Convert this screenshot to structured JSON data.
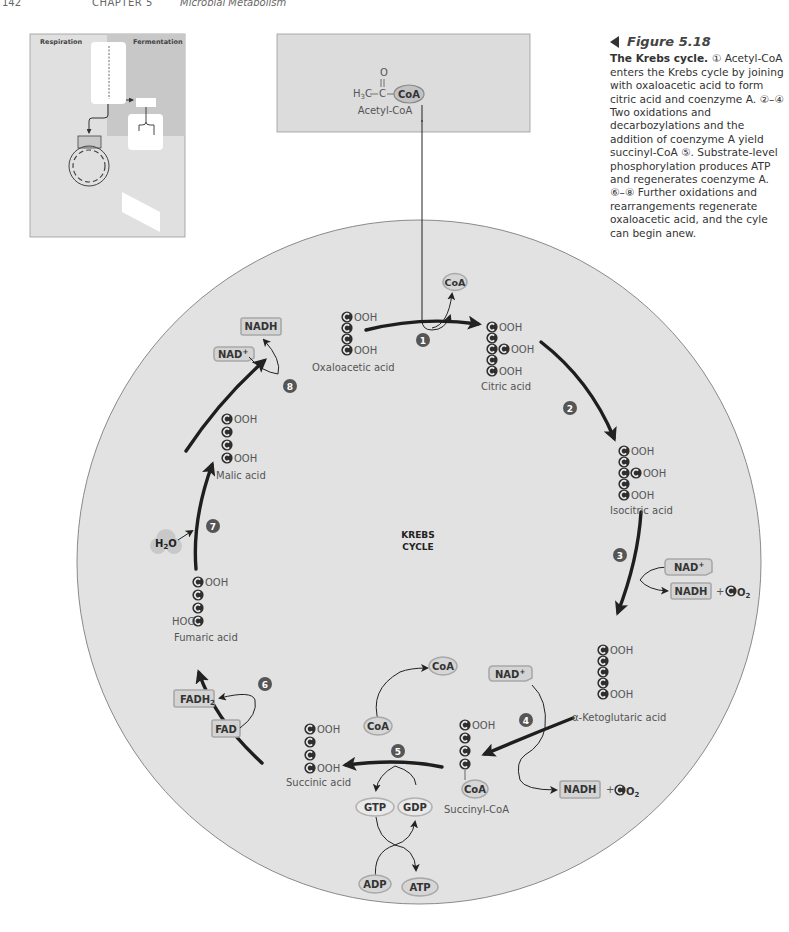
{
  "page_header": {
    "page_number": "142",
    "chapter": "CHAPTER 5",
    "chapter_title": "Microbial Metabolism"
  },
  "caption": {
    "figure_label": "Figure 5.18",
    "lead": "The Krebs cycle.",
    "body": "① Acetyl-CoA enters the Krebs cycle by joining with oxaloacetic acid to form citric acid and coenzyme A. ②–④ Two oxidations and decarbozylations and the addition of coenzyme A yield succinyl-CoA ⑤. Substrate-level phosphorylation produces ATP and regenerates coenzyme A. ⑥–⑧ Further oxidations and rearrangements regenerate oxaloacetic acid, and the cyle can begin anew."
  },
  "thumbnail": {
    "left_label": "Respiration",
    "right_label": "Fermentation"
  },
  "acetyl_box": {
    "formula_left": "H3C",
    "formula_o": "O",
    "formula_c": "C",
    "coa": "CoA",
    "name": "Acetyl-CoA"
  },
  "cycle": {
    "title_line1": "KREBS",
    "title_line2": "CYCLE",
    "carbon_glyph": "C",
    "cooh": "OOH",
    "hoo": "HOO",
    "compounds": [
      {
        "id": "oxaloacetic",
        "name": "Oxaloacetic acid"
      },
      {
        "id": "citric",
        "name": "Citric acid"
      },
      {
        "id": "isocitric",
        "name": "Isocitric acid"
      },
      {
        "id": "ketoglutaric",
        "name": "α-Ketoglutaric acid"
      },
      {
        "id": "succinyl-coa",
        "name": "Succinyl-CoA"
      },
      {
        "id": "succinic",
        "name": "Succinic acid"
      },
      {
        "id": "fumaric",
        "name": "Fumaric acid"
      },
      {
        "id": "malic",
        "name": "Malic acid"
      }
    ],
    "steps": [
      "1",
      "2",
      "3",
      "4",
      "5",
      "6",
      "7",
      "8"
    ],
    "cofactors": {
      "coa": "CoA",
      "nad": "NAD+",
      "nadh": "NADH",
      "plus": "+",
      "co2_o": "O",
      "co2_sub": "2",
      "fad": "FAD",
      "fadh": "FADH",
      "fadh_sub": "2",
      "gtp": "GTP",
      "gdp": "GDP",
      "adp": "ADP",
      "atp": "ATP",
      "h2o_h": "H",
      "h2o_sub": "2",
      "h2o_o": "O"
    }
  },
  "colors": {
    "cycle_fill": "#e3e3e3",
    "box_fill": "#dcdcdc",
    "carbon": "#333333",
    "badge": "#555555",
    "pill_fill": "#d4d4d4",
    "pill_stroke": "#a8a8a8",
    "arrow": "#222222"
  }
}
